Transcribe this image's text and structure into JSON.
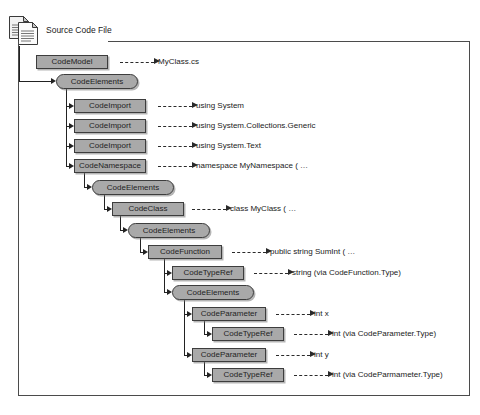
{
  "diagram": {
    "title": "Source Code File",
    "icon": "document-pages-icon",
    "colors": {
      "node_fill": "#a9a9a9",
      "node_border": "#3d3d3d",
      "line": "#222222",
      "frame": "#4b4b4b",
      "text": "#1a1a1a"
    },
    "nodes": [
      {
        "id": "n0",
        "label": "CodeModel",
        "shape": "rect",
        "x": 36,
        "y": 55,
        "w": 72
      },
      {
        "id": "n1",
        "label": "CodeElements",
        "shape": "pill",
        "x": 56,
        "y": 74,
        "w": 82
      },
      {
        "id": "n2",
        "label": "CodeImport",
        "shape": "rect",
        "x": 74,
        "y": 99,
        "w": 72
      },
      {
        "id": "n3",
        "label": "CodeImport",
        "shape": "rect",
        "x": 74,
        "y": 119,
        "w": 72
      },
      {
        "id": "n4",
        "label": "CodeImport",
        "shape": "rect",
        "x": 74,
        "y": 139,
        "w": 72
      },
      {
        "id": "n5",
        "label": "CodeNamespace",
        "shape": "rect",
        "x": 74,
        "y": 159,
        "w": 72
      },
      {
        "id": "n6",
        "label": "CodeElements",
        "shape": "pill",
        "x": 92,
        "y": 180,
        "w": 82
      },
      {
        "id": "n7",
        "label": "CodeClass",
        "shape": "rect",
        "x": 112,
        "y": 202,
        "w": 72
      },
      {
        "id": "n8",
        "label": "CodeElements",
        "shape": "pill",
        "x": 128,
        "y": 223,
        "w": 82
      },
      {
        "id": "n9",
        "label": "CodeFunction",
        "shape": "rect",
        "x": 148,
        "y": 245,
        "w": 74
      },
      {
        "id": "n10",
        "label": "CodeTypeRef",
        "shape": "rect",
        "x": 172,
        "y": 266,
        "w": 72
      },
      {
        "id": "n11",
        "label": "CodeElements",
        "shape": "pill",
        "x": 172,
        "y": 285,
        "w": 82
      },
      {
        "id": "n12",
        "label": "CodeParameter",
        "shape": "rect",
        "x": 192,
        "y": 307,
        "w": 74
      },
      {
        "id": "n13",
        "label": "CodeTypeRef",
        "shape": "rect",
        "x": 212,
        "y": 327,
        "w": 72
      },
      {
        "id": "n14",
        "label": "CodeParameter",
        "shape": "rect",
        "x": 192,
        "y": 348,
        "w": 74
      },
      {
        "id": "n15",
        "label": "CodeTypeRef",
        "shape": "rect",
        "x": 212,
        "y": 368,
        "w": 72
      }
    ],
    "annotations": [
      {
        "for": "n0",
        "text": "MyClass.cs",
        "dash_x": 120,
        "dash_w": 34,
        "text_x": 158,
        "y": 62
      },
      {
        "for": "n2",
        "text": "using System",
        "dash_x": 158,
        "dash_w": 34,
        "text_x": 196,
        "y": 106
      },
      {
        "for": "n3",
        "text": "using System.Collections.Generic",
        "dash_x": 158,
        "dash_w": 34,
        "text_x": 196,
        "y": 126
      },
      {
        "for": "n4",
        "text": "using System.Text",
        "dash_x": 158,
        "dash_w": 34,
        "text_x": 196,
        "y": 146
      },
      {
        "for": "n5",
        "text": "namespace MyNamespace ( …",
        "dash_x": 158,
        "dash_w": 34,
        "text_x": 196,
        "y": 166
      },
      {
        "for": "n7",
        "text": "class MyClass ( …",
        "dash_x": 192,
        "dash_w": 34,
        "text_x": 230,
        "y": 209
      },
      {
        "for": "n9",
        "text": "public string SumInt ( …",
        "dash_x": 232,
        "dash_w": 34,
        "text_x": 270,
        "y": 252
      },
      {
        "for": "n10",
        "text": "string (via CodeFunction.Type)",
        "dash_x": 254,
        "dash_w": 34,
        "text_x": 292,
        "y": 273
      },
      {
        "for": "n12",
        "text": "int x",
        "dash_x": 276,
        "dash_w": 34,
        "text_x": 314,
        "y": 314
      },
      {
        "for": "n13",
        "text": "int (via CodeParameter.Type)",
        "dash_x": 294,
        "dash_w": 34,
        "text_x": 332,
        "y": 334
      },
      {
        "for": "n14",
        "text": "int y",
        "dash_x": 276,
        "dash_w": 34,
        "text_x": 314,
        "y": 355
      },
      {
        "for": "n15",
        "text": "int (via CodeParmameter.Type)",
        "dash_x": 294,
        "dash_w": 34,
        "text_x": 332,
        "y": 375
      }
    ],
    "connectors": [
      {
        "from": "frame-left",
        "to": "n1",
        "stem_x": 19,
        "from_y": 46,
        "to_y": 81,
        "to_x": 56
      },
      {
        "from": "n1",
        "to": "n2",
        "stem_x": 66,
        "from_y": 89,
        "to_y": 106,
        "to_x": 74
      },
      {
        "from": "n1",
        "to": "n3",
        "stem_x": 66,
        "from_y": 89,
        "to_y": 126,
        "to_x": 74
      },
      {
        "from": "n1",
        "to": "n4",
        "stem_x": 66,
        "from_y": 89,
        "to_y": 146,
        "to_x": 74
      },
      {
        "from": "n1",
        "to": "n5",
        "stem_x": 66,
        "from_y": 89,
        "to_y": 166,
        "to_x": 74
      },
      {
        "from": "n5",
        "to": "n6",
        "stem_x": 84,
        "from_y": 173,
        "to_y": 187,
        "to_x": 92
      },
      {
        "from": "n6",
        "to": "n7",
        "stem_x": 104,
        "from_y": 195,
        "to_y": 209,
        "to_x": 112
      },
      {
        "from": "n7",
        "to": "n8",
        "stem_x": 120,
        "from_y": 216,
        "to_y": 230,
        "to_x": 128
      },
      {
        "from": "n8",
        "to": "n9",
        "stem_x": 140,
        "from_y": 238,
        "to_y": 252,
        "to_x": 148
      },
      {
        "from": "n9",
        "to": "n10",
        "stem_x": 164,
        "from_y": 259,
        "to_y": 273,
        "to_x": 172
      },
      {
        "from": "n9",
        "to": "n11",
        "stem_x": 164,
        "from_y": 259,
        "to_y": 292,
        "to_x": 172
      },
      {
        "from": "n11",
        "to": "n12",
        "stem_x": 184,
        "from_y": 300,
        "to_y": 314,
        "to_x": 192
      },
      {
        "from": "n11",
        "to": "n14",
        "stem_x": 184,
        "from_y": 300,
        "to_y": 355,
        "to_x": 192
      },
      {
        "from": "n12",
        "to": "n13",
        "stem_x": 204,
        "from_y": 321,
        "to_y": 334,
        "to_x": 212
      },
      {
        "from": "n14",
        "to": "n15",
        "stem_x": 204,
        "from_y": 362,
        "to_y": 375,
        "to_x": 212
      }
    ]
  }
}
